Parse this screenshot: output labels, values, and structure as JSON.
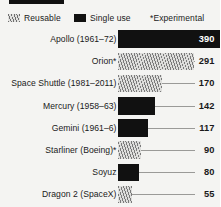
{
  "legend": {
    "items": [
      {
        "label": "Reusable",
        "swatch": "hatch-swatch-icon",
        "style": "hatch"
      },
      {
        "label": "Single use",
        "swatch": "solid-swatch-icon",
        "style": "solid"
      },
      {
        "label": "*Experimental",
        "swatch": "none",
        "style": "none"
      }
    ]
  },
  "chart_data": {
    "type": "bar",
    "orientation": "horizontal",
    "title": "",
    "subtitle": "",
    "xlabel": "",
    "ylabel": "",
    "xlim": [
      0,
      390
    ],
    "grid": false,
    "legend_position": "top",
    "legend_entries": [
      "Reusable",
      "Single use",
      "*Experimental"
    ],
    "categories": [
      "Apollo (1961–72)",
      "Orion*",
      "Space Shuttle (1981–2011)",
      "Mercury (1958–63)",
      "Gemini (1961–6)",
      "Starliner (Boeing)*",
      "Soyuz",
      "Dragon 2 (SpaceX)"
    ],
    "values": [
      390,
      291,
      170,
      142,
      117,
      90,
      80,
      55
    ],
    "series": [
      {
        "name": "Capsule volume",
        "values": [
          390,
          291,
          170,
          142,
          117,
          90,
          80,
          55
        ]
      }
    ],
    "bars": [
      {
        "label": "Apollo (1961–72)",
        "value": 390,
        "value_text": "390",
        "style": "solid",
        "experimental": false,
        "label_inside": true
      },
      {
        "label": "Orion*",
        "value": 291,
        "value_text": "291",
        "style": "hatch",
        "experimental": true,
        "label_inside": false
      },
      {
        "label": "Space Shuttle (1981–2011)",
        "value": 170,
        "value_text": "170",
        "style": "hatch",
        "experimental": false,
        "label_inside": false
      },
      {
        "label": "Mercury (1958–63)",
        "value": 142,
        "value_text": "142",
        "style": "solid",
        "experimental": false,
        "label_inside": false
      },
      {
        "label": "Gemini (1961–6)",
        "value": 117,
        "value_text": "117",
        "style": "solid",
        "experimental": false,
        "label_inside": false
      },
      {
        "label": "Starliner (Boeing)*",
        "value": 90,
        "value_text": "90",
        "style": "hatch",
        "experimental": true,
        "label_inside": false
      },
      {
        "label": "Soyuz",
        "value": 80,
        "value_text": "80",
        "style": "solid",
        "experimental": false,
        "label_inside": false
      },
      {
        "label": "Dragon 2 (SpaceX)",
        "value": 55,
        "value_text": "55",
        "style": "hatch",
        "experimental": false,
        "label_inside": false
      }
    ]
  }
}
